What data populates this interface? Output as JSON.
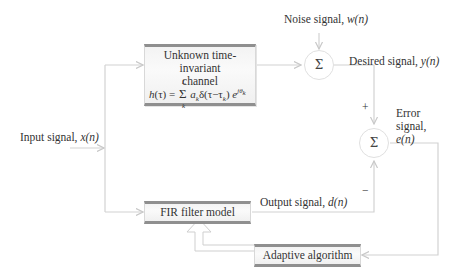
{
  "blocks": {
    "channel": {
      "title_line1": "Unknown time-invariant",
      "title_line2": "channel",
      "equation": "h(τ) = Σ_k^L a_k δ(τ − τ_k) e^{jθ_k}"
    },
    "fir": {
      "label": "FIR filter model"
    },
    "adaptive": {
      "label": "Adaptive algorithm"
    },
    "sum1": {
      "symbol": "Σ"
    },
    "sum2": {
      "symbol": "Σ"
    }
  },
  "signals": {
    "input": {
      "text": "Input signal, ",
      "var": "x(n)"
    },
    "noise": {
      "text": "Noise signal, ",
      "var": "w(n)"
    },
    "desired": {
      "text": "Desired signal, ",
      "var": "y(n)"
    },
    "error_line1": "Error",
    "error_line2": "signal,",
    "error_var": "e(n)",
    "output": {
      "text": "Output signal, ",
      "var": "d(n)"
    }
  },
  "signs": {
    "plus": "+",
    "minus": "−"
  },
  "colors": {
    "wire": "#cfcfcf",
    "box_border": "#8f8f8f",
    "text": "#333333"
  }
}
